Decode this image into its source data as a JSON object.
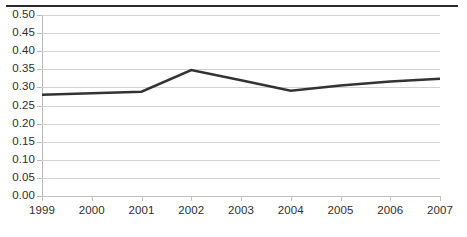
{
  "chart_data": {
    "type": "line",
    "title": "",
    "subtitle": "",
    "xlabel": "",
    "ylabel": "",
    "categories": [
      "1999",
      "2000",
      "2001",
      "2002",
      "2003",
      "2004",
      "2005",
      "2006",
      "2007"
    ],
    "x": [
      1999,
      2000,
      2001,
      2002,
      2003,
      2004,
      2005,
      2006,
      2007
    ],
    "series": [
      {
        "name": "",
        "values": [
          0.28,
          0.284,
          0.288,
          0.348,
          0.32,
          0.291,
          0.305,
          0.316,
          0.324
        ],
        "color": "#333333"
      }
    ],
    "ylim": [
      0.0,
      0.5
    ],
    "ytick_labels": [
      "0.50",
      "0.45",
      "0.40",
      "0.35",
      "0.30",
      "0.25",
      "0.20",
      "0.15",
      "0.10",
      "0.05",
      "0.00"
    ],
    "ytick_values": [
      0.5,
      0.45,
      0.4,
      0.35,
      0.3,
      0.25,
      0.2,
      0.15,
      0.1,
      0.05,
      0.0
    ],
    "ytick_step": 0.05,
    "grid": true,
    "grid_axis": "y",
    "legend": false,
    "legend_position": "none",
    "markers": false,
    "line_width_px": 2.5,
    "annotations": []
  },
  "style": {
    "background_color": "#ffffff",
    "grid_color": "#d2d2d2",
    "axis_color": "#b9b9b9",
    "text_color": "#2e2e2e",
    "series_color": "#333333",
    "top_rule_color": "#2b2b2b"
  }
}
